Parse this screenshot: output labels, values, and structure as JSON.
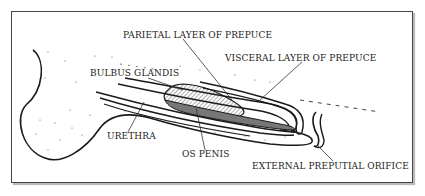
{
  "diagram": {
    "labels": {
      "parietal_layer": "PARIETAL LAYER OF PREPUCE",
      "visceral_layer": "VISCERAL LAYER OF PREPUCE",
      "bulbus_glandis": "BULBUS GLANDIS",
      "urethra": "URETHRA",
      "os_penis": "OS PENIS",
      "external_orifice": "EXTERNAL PREPUTIAL ORIFICE"
    },
    "colors": {
      "line": "#1a1a1a",
      "text": "#222222",
      "frame": "#444444",
      "background": "#ffffff"
    }
  }
}
